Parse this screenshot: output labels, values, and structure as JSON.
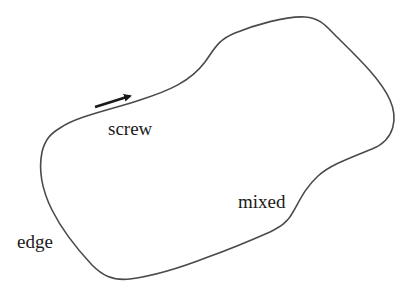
{
  "diagram": {
    "colors": {
      "line": "#4a4a4a",
      "arrow": "#1a1a1a",
      "text": "#1a1a1a",
      "background": "#ffffff"
    },
    "labels": {
      "screw": "screw",
      "mixed": "mixed",
      "edge": "edge"
    },
    "arrow": {
      "meaning": "burgers-vector",
      "from": [
        95,
        107
      ],
      "to": [
        132,
        95
      ]
    }
  }
}
